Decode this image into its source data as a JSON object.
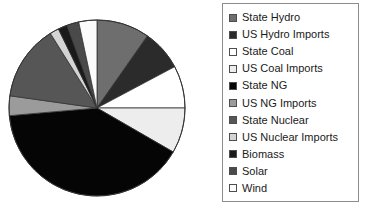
{
  "chart_data": {
    "type": "pie",
    "title": "",
    "legend_position": "right",
    "categories": [
      "State Hydro",
      "US Hydro Imports",
      "State Coal",
      "US Coal Imports",
      "State NG",
      "US NG Imports",
      "State Nuclear",
      "US Nuclear Imports",
      "Biomass",
      "Solar",
      "Wind"
    ],
    "values": [
      9.7,
      7.5,
      7.8,
      8.3,
      40.3,
      3.6,
      13.9,
      1.7,
      2.5,
      1.4,
      3.3
    ],
    "units": "percent",
    "colors": [
      "#6e6e6e",
      "#2b2b2b",
      "#ffffff",
      "#ededed",
      "#050505",
      "#9b9b9b",
      "#565656",
      "#d4d4d4",
      "#1a1a1a",
      "#4a4a4a",
      "#fbfbfb"
    ],
    "slice_start_angles_deg": [
      0,
      35,
      62,
      90,
      120,
      265,
      278,
      328,
      334,
      340,
      348
    ],
    "slice_sweep_angles_deg": [
      35,
      27,
      28,
      30,
      145,
      13,
      50,
      6,
      6,
      8,
      12
    ],
    "geometry": {
      "cx": 97,
      "cy": 108,
      "r": 88
    },
    "border_color": "#333333"
  },
  "legend": {
    "border_color": "#8c8c8c",
    "entries": [
      {
        "label": "State Hydro",
        "color": "#6e6e6e",
        "icon": "legend-swatch-icon"
      },
      {
        "label": "US Hydro Imports",
        "color": "#2b2b2b",
        "icon": "legend-swatch-icon"
      },
      {
        "label": "State Coal",
        "color": "#ffffff",
        "icon": "legend-swatch-icon"
      },
      {
        "label": "US Coal Imports",
        "color": "#ededed",
        "icon": "legend-swatch-icon"
      },
      {
        "label": "State NG",
        "color": "#050505",
        "icon": "legend-swatch-icon"
      },
      {
        "label": "US NG Imports",
        "color": "#9b9b9b",
        "icon": "legend-swatch-icon"
      },
      {
        "label": "State Nuclear",
        "color": "#565656",
        "icon": "legend-swatch-icon"
      },
      {
        "label": "US Nuclear Imports",
        "color": "#d4d4d4",
        "icon": "legend-swatch-icon"
      },
      {
        "label": "Biomass",
        "color": "#1a1a1a",
        "icon": "legend-swatch-icon"
      },
      {
        "label": "Solar",
        "color": "#4a4a4a",
        "icon": "legend-swatch-icon"
      },
      {
        "label": "Wind",
        "color": "#fbfbfb",
        "icon": "legend-swatch-icon"
      }
    ]
  }
}
